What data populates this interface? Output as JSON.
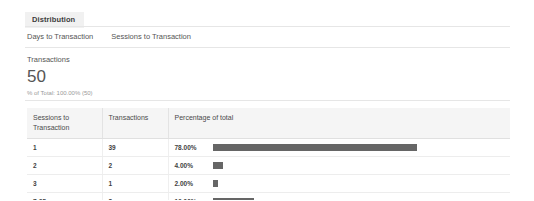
{
  "panel": {
    "primary_tab": "Distribution",
    "subtabs": [
      {
        "label": "Days to Transaction"
      },
      {
        "label": "Sessions to Transaction"
      }
    ]
  },
  "metric": {
    "label": "Transactions",
    "value": "50",
    "subtext": "% of Total: 100.00% (50)"
  },
  "table": {
    "headers": [
      "Sessions to Transaction",
      "Transactions",
      "Percentage of total"
    ],
    "rows": [
      {
        "dimension": "1",
        "transactions": "39",
        "percent_label": "78.00%",
        "percent_value": 78
      },
      {
        "dimension": "2",
        "transactions": "2",
        "percent_label": "4.00%",
        "percent_value": 4
      },
      {
        "dimension": "3",
        "transactions": "1",
        "percent_label": "2.00%",
        "percent_value": 2
      },
      {
        "dimension": "7-25",
        "transactions": "8",
        "percent_label": "16.00%",
        "percent_value": 16
      }
    ]
  },
  "chart_data": {
    "type": "bar",
    "title": "Sessions to Transaction",
    "xlabel": "Percentage of total",
    "ylabel": "Sessions to Transaction",
    "categories": [
      "1",
      "2",
      "3",
      "7-25"
    ],
    "values": [
      78,
      4,
      2,
      16
    ],
    "counts": [
      39,
      2,
      1,
      8
    ],
    "value_labels": [
      "78.00%",
      "4.00%",
      "2.00%",
      "16.00%"
    ],
    "total": 50,
    "xlim": [
      0,
      100
    ],
    "grid": false,
    "legend": "none",
    "orientation": "horizontal"
  },
  "colors": {
    "bar": "#666666",
    "header_bg": "#f5f5f5",
    "tab_bg": "#f1f1f1",
    "divider": "#e6e6e6"
  }
}
